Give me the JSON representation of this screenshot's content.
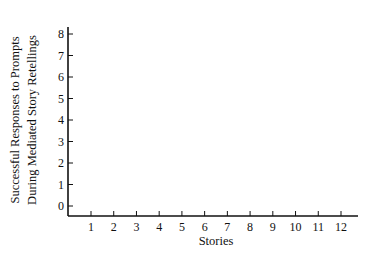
{
  "chart_data": {
    "type": "line",
    "title": "",
    "xlabel": "Stories",
    "ylabel_lines": [
      "Successful Responses to Prompts",
      "During Mediated Story Retellings"
    ],
    "ylabel": "Successful Responses to Prompts During Mediated Story Retellings",
    "categories": [
      "1",
      "2",
      "3",
      "4",
      "5",
      "6",
      "7",
      "8",
      "9",
      "10",
      "11",
      "12"
    ],
    "y_ticks": [
      "0",
      "1",
      "2",
      "3",
      "4",
      "5",
      "6",
      "7",
      "8"
    ],
    "ylim": [
      0,
      8
    ],
    "xlim": [
      1,
      12
    ],
    "series": [],
    "grid": false,
    "legend": null,
    "note": "Blank graph template with no plotted data"
  }
}
